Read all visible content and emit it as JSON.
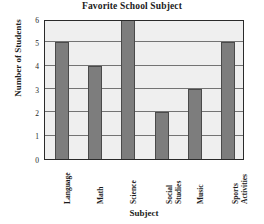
{
  "chart_data": {
    "type": "bar",
    "title": "Favorite School Subject",
    "xlabel": "Subject",
    "ylabel": "Number of Students",
    "categories": [
      "Language",
      "Math",
      "Science",
      "Social Studies",
      "Music",
      "Sports Activities"
    ],
    "values": [
      5,
      4,
      6,
      2,
      3,
      5
    ],
    "ylim": [
      0,
      6
    ],
    "yticks": [
      6,
      5,
      4,
      3,
      2,
      1,
      0
    ],
    "grid": true,
    "legend": false,
    "colors": {
      "bar_fill": "#7d7d7d",
      "bar_edge": "#4a4a4a",
      "plot_background": "#efefef",
      "gridline": "#737373",
      "axis_border": "#2a2a2a",
      "text": "#1b1b1b"
    }
  }
}
